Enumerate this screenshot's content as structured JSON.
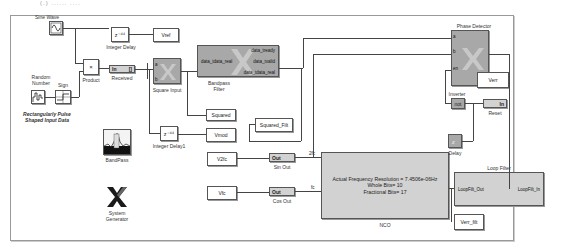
{
  "top_caption_fragment": "(.)  ......  ....",
  "blocks": {
    "sine_wave": {
      "label": "Sine Wave"
    },
    "random_number": {
      "label": "Random Number"
    },
    "sign": {
      "label": "Sign"
    },
    "product": {
      "label": "Product",
      "symbol": "×"
    },
    "integer_delay": {
      "label": "Integer Delay",
      "symbol": "z⁻⁴⁴"
    },
    "integer_delay1": {
      "label": "Integer Delay1",
      "symbol": "z⁻⁴⁴"
    },
    "vref": {
      "label": "Vref"
    },
    "received": {
      "label": "Received",
      "text_in": "In",
      "text_out": "[]"
    },
    "square_input": {
      "label": "Square Input",
      "ports": [
        "a",
        "b"
      ],
      "expr": "a × b (?)"
    },
    "bandpass_filter": {
      "label": "Bandpass Filter",
      "input": "data_tdata_real",
      "outputs": [
        "data_tready",
        "data_tvalid",
        "data_tdata_real"
      ]
    },
    "squared": {
      "label": "Squared"
    },
    "squared_filt": {
      "label": "Squared_Filt"
    },
    "vmod": {
      "label": "Vmod"
    },
    "bandpass_scope": {
      "label": "BandPass"
    },
    "system_generator": {
      "label": "System Generator"
    },
    "v2fc": {
      "label": "V2fc"
    },
    "vfc": {
      "label": "Vfc"
    },
    "sin_out": {
      "label": "Sin Out",
      "text": "Out"
    },
    "cos_out": {
      "label": "Cos Out",
      "text": "Out"
    },
    "nco": {
      "label": "NCO",
      "line1": "Actual Frequency Resolution = 7.4506e-06Hz",
      "line2": "Whole Bits= 10",
      "line3": "Fractional Bits= 17",
      "port_2fc": "2fc",
      "port_fc": "fc"
    },
    "phase_detector": {
      "label": "Phase Detector",
      "ports": [
        "a",
        "b",
        "en"
      ],
      "expr": "a × b (?)"
    },
    "verr": {
      "label": "Verr"
    },
    "inverter": {
      "label": "Inverter",
      "text": "not"
    },
    "reset": {
      "label": "Reset",
      "text": "In"
    },
    "step": {
      "label": "Step"
    },
    "delay": {
      "label": "Delay"
    },
    "loop_filter": {
      "label": "Loop Filter",
      "out_port": "LoopFilt_Out",
      "in_port": "LoopFilt_In"
    },
    "verr_filt": {
      "label": "Verr_filt"
    }
  },
  "annotation": {
    "line1": "Rectangularly Pulse",
    "line2": "Shaped Input Data"
  }
}
